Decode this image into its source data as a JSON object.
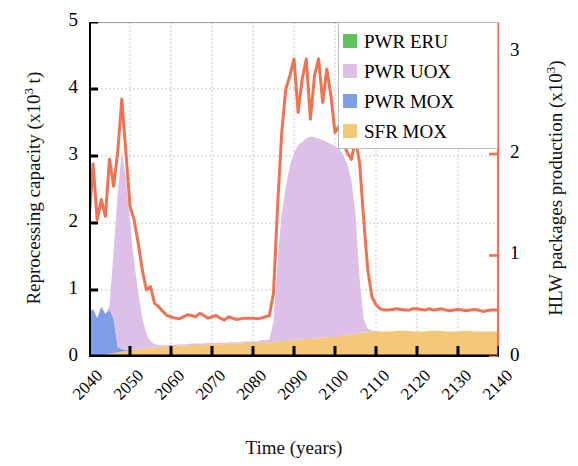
{
  "chart_data": {
    "type": "area",
    "title": "",
    "xlabel": "Time (years)",
    "ylabel": "Reprocessing capacity (x10³ t)",
    "ylabel_right": "HLW packages production (x10³)",
    "xlim": [
      2040,
      2140
    ],
    "ylim": [
      0,
      5
    ],
    "ylim_right": [
      0,
      3.3
    ],
    "xticks": [
      2040,
      2050,
      2060,
      2070,
      2080,
      2090,
      2100,
      2110,
      2120,
      2130,
      2140
    ],
    "xticklabels": [
      "2040",
      "2050",
      "2060",
      "2070",
      "2080",
      "2090",
      "2100",
      "2110",
      "2120",
      "2130",
      "2140"
    ],
    "yticks_left": [
      0,
      1,
      2,
      3,
      4,
      5
    ],
    "yticklabels_left": [
      "0",
      "1",
      "2",
      "3",
      "4",
      "5"
    ],
    "yticks_right": [
      0,
      1,
      2,
      3
    ],
    "yticklabels_right": [
      "0",
      "1",
      "2",
      "3"
    ],
    "grid": true,
    "legend_position": "upper right",
    "legend": [
      {
        "label": "PWR ERU",
        "color": "#5cc45c"
      },
      {
        "label": "PWR UOX",
        "color": "#dcc0e8"
      },
      {
        "label": "PWR MOX",
        "color": "#7e9fe8"
      },
      {
        "label": "SFR MOX",
        "color": "#f4c878"
      }
    ],
    "x": [
      2040,
      2041,
      2042,
      2043,
      2044,
      2045,
      2046,
      2047,
      2048,
      2049,
      2050,
      2051,
      2052,
      2053,
      2054,
      2055,
      2056,
      2057,
      2058,
      2059,
      2060,
      2061,
      2062,
      2063,
      2064,
      2065,
      2066,
      2067,
      2068,
      2069,
      2070,
      2071,
      2072,
      2073,
      2074,
      2075,
      2076,
      2077,
      2078,
      2079,
      2080,
      2081,
      2082,
      2083,
      2084,
      2085,
      2086,
      2087,
      2088,
      2089,
      2090,
      2091,
      2092,
      2093,
      2094,
      2095,
      2096,
      2097,
      2098,
      2099,
      2100,
      2101,
      2102,
      2103,
      2104,
      2105,
      2106,
      2107,
      2108,
      2109,
      2110,
      2111,
      2112,
      2113,
      2114,
      2115,
      2116,
      2117,
      2118,
      2119,
      2120,
      2121,
      2122,
      2123,
      2124,
      2125,
      2126,
      2127,
      2128,
      2129,
      2130,
      2131,
      2132,
      2133,
      2134,
      2135,
      2136,
      2137,
      2138,
      2139,
      2140
    ],
    "series": [
      {
        "name": "SFR MOX",
        "color": "#f4c878",
        "stack": 1,
        "values": [
          0.02,
          0.02,
          0.03,
          0.03,
          0.04,
          0.05,
          0.06,
          0.07,
          0.08,
          0.09,
          0.1,
          0.11,
          0.12,
          0.13,
          0.13,
          0.14,
          0.14,
          0.15,
          0.15,
          0.16,
          0.16,
          0.16,
          0.17,
          0.17,
          0.17,
          0.18,
          0.18,
          0.18,
          0.18,
          0.19,
          0.19,
          0.19,
          0.19,
          0.19,
          0.2,
          0.2,
          0.2,
          0.2,
          0.21,
          0.21,
          0.21,
          0.21,
          0.22,
          0.22,
          0.22,
          0.23,
          0.23,
          0.24,
          0.24,
          0.25,
          0.25,
          0.26,
          0.26,
          0.27,
          0.27,
          0.28,
          0.28,
          0.29,
          0.29,
          0.3,
          0.3,
          0.31,
          0.32,
          0.33,
          0.34,
          0.35,
          0.36,
          0.37,
          0.37,
          0.38,
          0.38,
          0.38,
          0.38,
          0.38,
          0.38,
          0.39,
          0.39,
          0.39,
          0.39,
          0.38,
          0.38,
          0.38,
          0.38,
          0.39,
          0.39,
          0.39,
          0.39,
          0.38,
          0.38,
          0.38,
          0.38,
          0.39,
          0.39,
          0.39,
          0.38,
          0.38,
          0.38,
          0.38,
          0.38,
          0.38,
          0.38
        ]
      },
      {
        "name": "PWR MOX",
        "color": "#7e9fe8",
        "stack": 2,
        "values": [
          0.62,
          0.7,
          0.55,
          0.72,
          0.6,
          0.66,
          0.52,
          0.08,
          0.04,
          0.02,
          0.01,
          0.0,
          0.0,
          0.0,
          0.0,
          0.0,
          0.0,
          0.0,
          0.0,
          0.0,
          0.0,
          0.0,
          0.0,
          0.0,
          0.0,
          0.0,
          0.0,
          0.0,
          0.0,
          0.0,
          0.0,
          0.0,
          0.0,
          0.0,
          0.0,
          0.0,
          0.0,
          0.0,
          0.0,
          0.0,
          0.0,
          0.0,
          0.0,
          0.0,
          0.0,
          0.0,
          0.0,
          0.0,
          0.0,
          0.0,
          0.0,
          0.0,
          0.0,
          0.0,
          0.0,
          0.0,
          0.0,
          0.0,
          0.0,
          0.0,
          0.0,
          0.0,
          0.0,
          0.0,
          0.0,
          0.0,
          0.0,
          0.0,
          0.0,
          0.0,
          0.0,
          0.0,
          0.0,
          0.0,
          0.0,
          0.0,
          0.0,
          0.0,
          0.0,
          0.0,
          0.0,
          0.0,
          0.0,
          0.0,
          0.0,
          0.0,
          0.0,
          0.0,
          0.0,
          0.0,
          0.0,
          0.0,
          0.0,
          0.0,
          0.0,
          0.0,
          0.0,
          0.0,
          0.0,
          0.0,
          0.0
        ]
      },
      {
        "name": "PWR UOX",
        "color": "#dcc0e8",
        "stack": 3,
        "values": [
          0.0,
          0.0,
          0.0,
          0.0,
          0.0,
          0.05,
          1.0,
          2.3,
          2.95,
          2.55,
          1.9,
          1.3,
          0.85,
          0.45,
          0.22,
          0.1,
          0.05,
          0.03,
          0.02,
          0.02,
          0.02,
          0.02,
          0.02,
          0.02,
          0.02,
          0.02,
          0.02,
          0.02,
          0.02,
          0.02,
          0.02,
          0.02,
          0.02,
          0.02,
          0.02,
          0.02,
          0.02,
          0.02,
          0.02,
          0.02,
          0.02,
          0.02,
          0.03,
          0.03,
          0.04,
          0.3,
          1.2,
          1.9,
          2.3,
          2.6,
          2.8,
          2.9,
          2.95,
          3.0,
          3.02,
          3.0,
          2.98,
          2.95,
          2.92,
          2.88,
          2.85,
          2.8,
          2.7,
          2.55,
          2.3,
          1.8,
          0.8,
          0.2,
          0.05,
          0.02,
          0.01,
          0.0,
          0.0,
          0.0,
          0.0,
          0.0,
          0.0,
          0.0,
          0.0,
          0.0,
          0.0,
          0.0,
          0.0,
          0.0,
          0.0,
          0.0,
          0.0,
          0.0,
          0.0,
          0.0,
          0.0,
          0.0,
          0.0,
          0.0,
          0.0,
          0.0,
          0.0,
          0.0,
          0.0,
          0.0,
          0.0
        ]
      },
      {
        "name": "PWR ERU",
        "color": "#5cc45c",
        "stack": 4,
        "values": [
          0.0,
          0.0,
          0.0,
          0.0,
          0.0,
          0.0,
          0.0,
          0.0,
          0.0,
          0.0,
          0.0,
          0.0,
          0.0,
          0.0,
          0.0,
          0.0,
          0.0,
          0.0,
          0.0,
          0.0,
          0.0,
          0.0,
          0.0,
          0.0,
          0.0,
          0.0,
          0.0,
          0.0,
          0.0,
          0.0,
          0.0,
          0.0,
          0.0,
          0.0,
          0.0,
          0.0,
          0.0,
          0.0,
          0.0,
          0.0,
          0.0,
          0.0,
          0.0,
          0.0,
          0.0,
          0.0,
          0.0,
          0.0,
          0.0,
          0.0,
          0.0,
          0.0,
          0.0,
          0.0,
          0.0,
          0.0,
          0.0,
          0.0,
          0.0,
          0.0,
          0.0,
          0.0,
          0.0,
          0.0,
          0.0,
          0.0,
          0.0,
          0.0,
          0.0,
          0.0,
          0.0,
          0.0,
          0.0,
          0.0,
          0.0,
          0.0,
          0.0,
          0.0,
          0.0,
          0.0,
          0.0,
          0.0,
          0.0,
          0.0,
          0.0,
          0.0,
          0.0,
          0.0,
          0.0,
          0.0,
          0.0,
          0.0,
          0.0,
          0.0,
          0.0,
          0.0,
          0.0,
          0.0,
          0.0,
          0.0,
          0.0
        ]
      }
    ],
    "line_series": {
      "name": "HLW packages production",
      "color": "#ef7352",
      "axis": "right",
      "values_left_scale": [
        2.02,
        2.88,
        2.05,
        2.35,
        2.1,
        2.95,
        2.55,
        3.05,
        3.85,
        3.05,
        2.25,
        2.05,
        1.7,
        1.3,
        1.0,
        1.05,
        0.8,
        0.75,
        0.68,
        0.62,
        0.6,
        0.58,
        0.57,
        0.6,
        0.63,
        0.62,
        0.6,
        0.65,
        0.62,
        0.58,
        0.6,
        0.62,
        0.58,
        0.55,
        0.6,
        0.58,
        0.56,
        0.57,
        0.58,
        0.58,
        0.58,
        0.57,
        0.58,
        0.6,
        0.62,
        0.95,
        2.25,
        3.35,
        4.0,
        4.2,
        4.45,
        3.65,
        4.15,
        4.45,
        3.55,
        4.2,
        4.45,
        3.8,
        4.3,
        3.9,
        3.35,
        3.45,
        3.2,
        3.05,
        2.95,
        3.25,
        2.9,
        2.05,
        1.3,
        0.9,
        0.78,
        0.72,
        0.7,
        0.7,
        0.71,
        0.72,
        0.71,
        0.7,
        0.7,
        0.72,
        0.72,
        0.71,
        0.7,
        0.72,
        0.7,
        0.71,
        0.72,
        0.7,
        0.69,
        0.7,
        0.71,
        0.7,
        0.69,
        0.7,
        0.71,
        0.7,
        0.68,
        0.69,
        0.7,
        0.7,
        0.7
      ]
    }
  },
  "axes": {
    "left_label": "Reprocessing capacity (x10³ t)",
    "right_label": "HLW packages production (x10³)",
    "x_label": "Time (years)"
  }
}
